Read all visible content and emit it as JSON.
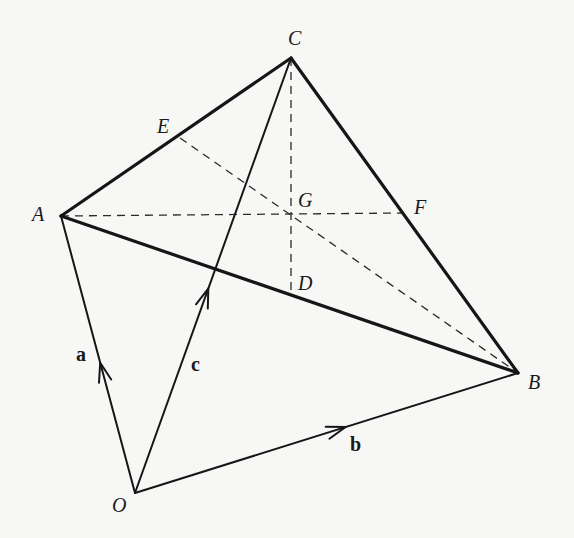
{
  "diagram": {
    "points": {
      "O": {
        "label": "O",
        "x": 135,
        "y": 493,
        "lx": 112,
        "ly": 512
      },
      "A": {
        "label": "A",
        "x": 61,
        "y": 216,
        "lx": 32,
        "ly": 221
      },
      "B": {
        "label": "B",
        "x": 518,
        "y": 373,
        "lx": 528,
        "ly": 389
      },
      "C": {
        "label": "C",
        "x": 291,
        "y": 58,
        "lx": 288,
        "ly": 45
      },
      "D": {
        "label": "D",
        "x": 291,
        "y": 296,
        "lx": 298,
        "ly": 290
      },
      "E": {
        "label": "E",
        "x": 180,
        "y": 138,
        "lx": 157,
        "ly": 133
      },
      "F": {
        "label": "F",
        "x": 404,
        "y": 213,
        "lx": 414,
        "ly": 214
      },
      "G": {
        "label": "G",
        "x": 291,
        "y": 213,
        "lx": 298,
        "ly": 207
      }
    },
    "vectors": {
      "a": {
        "label": "a",
        "from": "O",
        "to": "A",
        "lx": 76,
        "ly": 361
      },
      "b": {
        "label": "b",
        "from": "O",
        "to": "B",
        "lx": 350,
        "ly": 451
      },
      "c": {
        "label": "c",
        "from": "O",
        "to": "C",
        "lx": 191,
        "ly": 371
      }
    },
    "thick_edges": [
      [
        "A",
        "C"
      ],
      [
        "C",
        "B"
      ],
      [
        "A",
        "B"
      ]
    ],
    "thin_edges": [
      [
        "O",
        "A"
      ],
      [
        "O",
        "B"
      ],
      [
        "O",
        "C"
      ]
    ],
    "dashed_segments": [
      [
        "C",
        "D"
      ],
      [
        "A",
        "F"
      ],
      [
        "E",
        "B"
      ]
    ],
    "colors": {
      "ink": "#161616",
      "paper": "#f7f7f5"
    }
  }
}
